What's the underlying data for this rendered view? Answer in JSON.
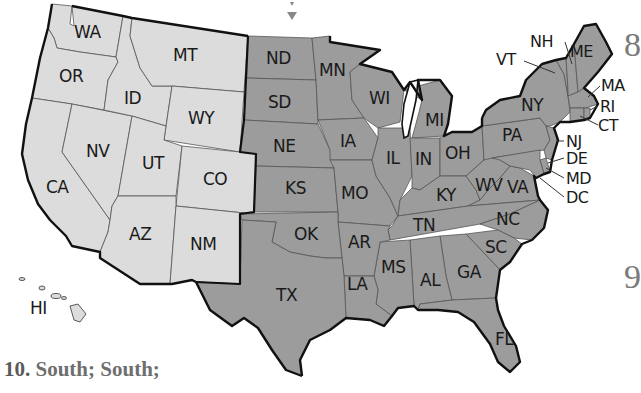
{
  "map": {
    "title": "United States regions map",
    "colors": {
      "west_fill": "#dcdcdc",
      "other_fill": "#9c9c9c",
      "border": "#111111",
      "background": "#ffffff"
    },
    "regions": {
      "west": [
        "WA",
        "OR",
        "CA",
        "NV",
        "ID",
        "MT",
        "WY",
        "UT",
        "CO",
        "AZ",
        "NM",
        "HI"
      ],
      "other": [
        "ND",
        "SD",
        "NE",
        "KS",
        "MN",
        "IA",
        "MO",
        "WI",
        "IL",
        "MI",
        "IN",
        "OH",
        "KY",
        "TN",
        "OK",
        "TX",
        "AR",
        "LA",
        "MS",
        "AL",
        "GA",
        "FL",
        "SC",
        "NC",
        "VA",
        "WV",
        "PA",
        "NY",
        "VT",
        "NH",
        "ME",
        "MA",
        "RI",
        "CT",
        "NJ",
        "DE",
        "MD",
        "DC"
      ]
    },
    "labels": {
      "WA": "WA",
      "OR": "OR",
      "CA": "CA",
      "NV": "NV",
      "ID": "ID",
      "MT": "MT",
      "WY": "WY",
      "UT": "UT",
      "CO": "CO",
      "AZ": "AZ",
      "NM": "NM",
      "HI": "HI",
      "ND": "ND",
      "SD": "SD",
      "NE": "NE",
      "KS": "KS",
      "MN": "MN",
      "IA": "IA",
      "MO": "MO",
      "WI": "WI",
      "IL": "IL",
      "MI": "MI",
      "IN": "IN",
      "OH": "OH",
      "KY": "KY",
      "TN": "TN",
      "OK": "OK",
      "TX": "TX",
      "AR": "AR",
      "LA": "LA",
      "MS": "MS",
      "AL": "AL",
      "GA": "GA",
      "FL": "FL",
      "SC": "SC",
      "NC": "NC",
      "VA": "VA",
      "WV": "WV",
      "PA": "PA",
      "NY": "NY",
      "VT": "VT",
      "NH": "NH",
      "ME": "ME",
      "MA": "MA",
      "RI": "RI",
      "CT": "CT",
      "NJ": "NJ",
      "DE": "DE",
      "MD": "MD",
      "DC": "DC"
    }
  },
  "margin": {
    "number_top": "8",
    "number_bottom": "9"
  },
  "footer": {
    "answer_number": "10.",
    "answer_text": "South; South;"
  }
}
